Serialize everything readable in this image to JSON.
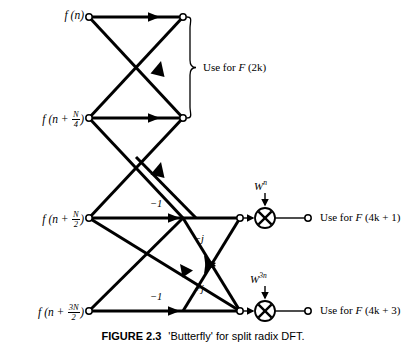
{
  "figure": {
    "caption_number": "FIGURE 2.3",
    "caption_text": "'Butterfly' for split radix DFT.",
    "diagram_type": "signal-flow-graph"
  },
  "inputs": [
    {
      "id": "in0",
      "label_prefix": "f",
      "label_body": "(n)",
      "has_fraction": false,
      "x": 89,
      "y": 17
    },
    {
      "id": "in1",
      "label_prefix": "f",
      "label_body": "(n + N/4)",
      "has_fraction": true,
      "frac_num": "N",
      "frac_den": "4",
      "x": 89,
      "y": 118
    },
    {
      "id": "in2",
      "label_prefix": "f",
      "label_body": "(n + N/2)",
      "has_fraction": true,
      "frac_num": "N",
      "frac_den": "2",
      "x": 89,
      "y": 218
    },
    {
      "id": "in3",
      "label_prefix": "f",
      "label_body": "(n + 3N/2)",
      "has_fraction": true,
      "frac_num": "3N",
      "frac_den": "2",
      "x": 89,
      "y": 311
    }
  ],
  "input_labels": {
    "in0_text": "f (n)",
    "in1_text": "f (n + N/4)",
    "in2_text": "f (n + N/2)",
    "in3_text": "f (n + 3N/2)"
  },
  "outputs": [
    {
      "id": "out_2k",
      "text": "Use for F (2k)",
      "static": "Use for ",
      "italic": "F",
      "rest": " (2k)"
    },
    {
      "id": "out_4k1",
      "text": "Use for F (4k + 1)",
      "static": "Use for ",
      "italic": "F",
      "rest": " (4k + 1)"
    },
    {
      "id": "out_4k3",
      "text": "Use for F (4k + 3)",
      "static": "Use for ",
      "italic": "F",
      "rest": " (4k + 3)"
    }
  ],
  "coefficients": [
    {
      "id": "coef_minus1_top",
      "text": "−1",
      "x": 152,
      "y": 200
    },
    {
      "id": "coef_minus1_bottom",
      "text": "−1",
      "x": 152,
      "y": 293
    },
    {
      "id": "coef_minus_j",
      "text": "−j",
      "x": 196,
      "y": 238
    },
    {
      "id": "coef_plus_j",
      "text": "+j",
      "x": 196,
      "y": 288
    }
  ],
  "twiddles": [
    {
      "id": "twiddle_wn",
      "base": "W",
      "exponent": "n",
      "x": 255,
      "y": 186
    },
    {
      "id": "twiddle_w3n",
      "base": "W",
      "exponent": "3n",
      "x": 252,
      "y": 279
    }
  ],
  "brace": {
    "id": "brace-2k",
    "top_y": 17,
    "bottom_y": 118,
    "x": 190,
    "label_x": 203,
    "label_y": 62
  },
  "multipliers": [
    {
      "id": "mult_top",
      "symbol": "cross-circle",
      "cx": 265,
      "cy": 218,
      "r": 10
    },
    {
      "id": "mult_bottom",
      "symbol": "cross-circle",
      "cx": 265,
      "cy": 311,
      "r": 10
    }
  ],
  "colors": {
    "line": "#000000",
    "background": "#ffffff",
    "node_fill": "#ffffff"
  },
  "geometry": {
    "node_radius": 3.2,
    "line_width": 3.0,
    "thin_line_width": 1.3,
    "rows": {
      "r0": 17,
      "r1": 118,
      "r2": 218,
      "r3": 311
    },
    "cols": {
      "c_in": 89,
      "c_mid": 136,
      "c_out1": 183,
      "c_node": 240,
      "c_mult": 265,
      "c_term": 308
    }
  }
}
